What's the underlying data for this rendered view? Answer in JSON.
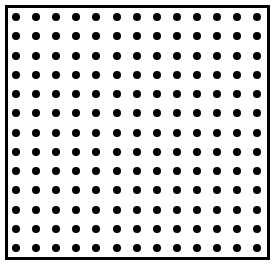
{
  "diagram": {
    "type": "dot-grid",
    "rows": 13,
    "cols": 13,
    "dot_color": "#000000",
    "border_color": "#000000",
    "background": "#ffffff",
    "first_dot": {
      "x": 16,
      "y": 17
    },
    "spacing": {
      "x": 20.1,
      "y": 19.25
    }
  }
}
